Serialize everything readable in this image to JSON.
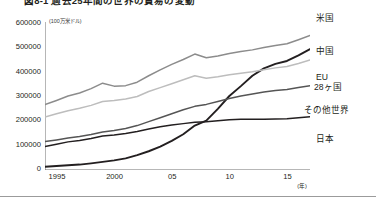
{
  "figure": {
    "title": "図8-1 過去25年間の世界の貿易の変動",
    "unit_caption": "(100万米ドル)",
    "x_axis_unit": "(年)"
  },
  "chart_data": {
    "type": "line",
    "title": "図8-1 過去25年間の世界の貿易の変動",
    "xlabel": "(年)",
    "ylabel": "(100万米ドル)",
    "xlim": [
      1995,
      2018
    ],
    "ylim": [
      0,
      600000
    ],
    "grid": false,
    "legend": "inline-right-labels",
    "ytick_labels": [
      "0",
      "100000",
      "200000",
      "300000",
      "400000",
      "500000",
      "600000"
    ],
    "ytick_values": [
      0,
      100000,
      200000,
      300000,
      400000,
      500000,
      600000
    ],
    "xtick_labels": [
      "1995",
      "2000",
      "05",
      "10",
      "15"
    ],
    "xtick_values": [
      1995,
      2000,
      2005,
      2010,
      2015
    ],
    "x": [
      1995,
      1996,
      1997,
      1998,
      1999,
      2000,
      2001,
      2002,
      2003,
      2004,
      2005,
      2006,
      2007,
      2008,
      2009,
      2010,
      2011,
      2012,
      2013,
      2014,
      2015,
      2016,
      2017,
      2018
    ],
    "series": [
      {
        "name": "米国",
        "label": "米国",
        "color": "#8c8c8c",
        "values": [
          265000,
          282000,
          300000,
          312000,
          330000,
          352000,
          340000,
          342000,
          356000,
          382000,
          406000,
          428000,
          448000,
          470000,
          455000,
          462000,
          472000,
          480000,
          487000,
          497000,
          505000,
          512000,
          528000,
          545000
        ]
      },
      {
        "name": "中国",
        "label": "中国",
        "color": "#231f20",
        "values": [
          13000,
          16000,
          19000,
          22000,
          27000,
          33000,
          39000,
          47000,
          60000,
          76000,
          95000,
          118000,
          145000,
          180000,
          200000,
          248000,
          300000,
          340000,
          382000,
          412000,
          430000,
          442000,
          465000,
          490000
        ]
      },
      {
        "name": "EU 28ヶ国",
        "label": "EU",
        "label2": "28ヶ国",
        "color": "#bdbdbd",
        "values": [
          215000,
          228000,
          240000,
          250000,
          262000,
          278000,
          282000,
          288000,
          298000,
          318000,
          334000,
          350000,
          366000,
          382000,
          372000,
          378000,
          386000,
          392000,
          398000,
          406000,
          414000,
          420000,
          432000,
          446000
        ]
      },
      {
        "name": "その他世界",
        "label": "その他世界",
        "color": "#555555",
        "values": [
          115000,
          122000,
          130000,
          136000,
          144000,
          154000,
          160000,
          168000,
          180000,
          196000,
          212000,
          228000,
          244000,
          258000,
          266000,
          278000,
          290000,
          300000,
          308000,
          316000,
          322000,
          326000,
          334000,
          342000
        ]
      },
      {
        "name": "日本",
        "label": "日本",
        "color": "#231f20",
        "values": [
          95000,
          104000,
          114000,
          120000,
          128000,
          138000,
          142000,
          148000,
          156000,
          166000,
          175000,
          182000,
          188000,
          194000,
          196000,
          200000,
          204000,
          206000,
          206000,
          206000,
          207000,
          208000,
          212000,
          216000
        ]
      }
    ]
  },
  "series_labels": {
    "us": "米国",
    "china": "中国",
    "eu_line1": "EU",
    "eu_line2": "28ヶ国",
    "row": "その他世界",
    "japan": "日本"
  }
}
